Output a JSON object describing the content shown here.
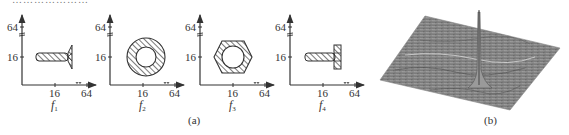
{
  "figure": {
    "top_cut_text": "…………………",
    "panel_a": {
      "caption": "(a)",
      "y_ticks": [
        "64",
        "16"
      ],
      "x_ticks": [
        "16",
        "64"
      ],
      "subplots": [
        {
          "label": "f",
          "subscript": "1",
          "shape": "countersunk-screw"
        },
        {
          "label": "f",
          "subscript": "2",
          "shape": "washer-ring"
        },
        {
          "label": "f",
          "subscript": "3",
          "shape": "hex-nut"
        },
        {
          "label": "f",
          "subscript": "4",
          "shape": "t-bolt"
        }
      ]
    },
    "panel_b": {
      "caption": "(b)",
      "content": "3D surface plot with single sharp peak"
    },
    "colors": {
      "line": "#333333",
      "hatch": "#333333",
      "surface": "#8a8a8a",
      "background": "#ffffff"
    }
  }
}
